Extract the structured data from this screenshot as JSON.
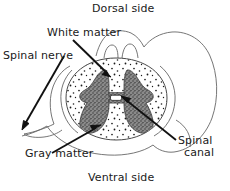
{
  "diagram": {
    "background_color": "#ffffff",
    "ink_color": "#1a1a1a",
    "gray_matter_color": "#6e6e6e",
    "white_matter_color": "#ffffff",
    "outline_color": "#555555",
    "labels": {
      "dorsal_side": "Dorsal side",
      "white_matter": "White matter",
      "spinal_nerve": "Spinal nerve",
      "gray_matter": "Gray matter",
      "spinal_canal_line1": "Spinal",
      "spinal_canal_line2": "canal",
      "ventral_side": "Ventral side"
    }
  }
}
